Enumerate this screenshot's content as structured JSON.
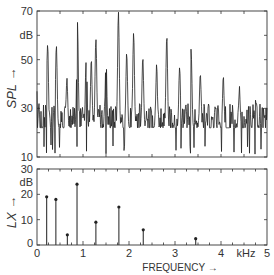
{
  "chart_data": [
    {
      "type": "line",
      "title": "",
      "ylabel": "SPL →",
      "yunit": "dB",
      "xlabel": "",
      "xlim": [
        0,
        5
      ],
      "ylim": [
        10,
        70
      ],
      "yticks": [
        10,
        30,
        50,
        70
      ],
      "yminor_ticks": [
        20,
        40,
        60
      ],
      "grid": false,
      "description": "Narrowband sound pressure level spectrum, dense noisy trace between roughly 12 and 70 dB with prominent peaks",
      "peaks": [
        {
          "x": 0.23,
          "y": 57
        },
        {
          "x": 0.42,
          "y": 56
        },
        {
          "x": 0.65,
          "y": 42
        },
        {
          "x": 0.88,
          "y": 64
        },
        {
          "x": 1.07,
          "y": 51
        },
        {
          "x": 1.18,
          "y": 49
        },
        {
          "x": 1.28,
          "y": 59
        },
        {
          "x": 1.5,
          "y": 50
        },
        {
          "x": 1.77,
          "y": 70
        },
        {
          "x": 1.95,
          "y": 53
        },
        {
          "x": 2.1,
          "y": 62
        },
        {
          "x": 2.3,
          "y": 51
        },
        {
          "x": 2.6,
          "y": 47
        },
        {
          "x": 2.82,
          "y": 60
        },
        {
          "x": 3.1,
          "y": 47
        },
        {
          "x": 3.35,
          "y": 55
        },
        {
          "x": 3.55,
          "y": 44
        },
        {
          "x": 4.05,
          "y": 42
        },
        {
          "x": 4.4,
          "y": 38
        },
        {
          "x": 4.75,
          "y": 34
        }
      ]
    },
    {
      "type": "bar",
      "style": "stem",
      "title": "",
      "ylabel": "LX →",
      "yunit": "dB",
      "xlabel": "FREQUENCY →",
      "xunit": "kHz",
      "xlim": [
        0,
        5
      ],
      "ylim": [
        0,
        30
      ],
      "xticks": [
        0,
        1,
        2,
        3,
        4,
        5
      ],
      "yticks": [
        0,
        10,
        20,
        30
      ],
      "grid": false,
      "x": [
        0.21,
        0.41,
        0.66,
        0.87,
        1.28,
        1.78,
        2.31,
        3.45
      ],
      "values": [
        19,
        18,
        4,
        24,
        9,
        15,
        6,
        2.5
      ]
    }
  ],
  "labels": {
    "upper": {
      "ylabel": "SPL →",
      "unit": "dB",
      "yticks": [
        "70",
        "50",
        "30",
        "10"
      ]
    },
    "lower": {
      "ylabel": "LX →",
      "unit": "dB",
      "yticks": [
        "30",
        "20",
        "10",
        "0"
      ],
      "xticks": [
        "0",
        "1",
        "2",
        "3",
        "4",
        "5"
      ],
      "xunit": "kHz",
      "xlabel": "FREQUENCY →"
    }
  }
}
